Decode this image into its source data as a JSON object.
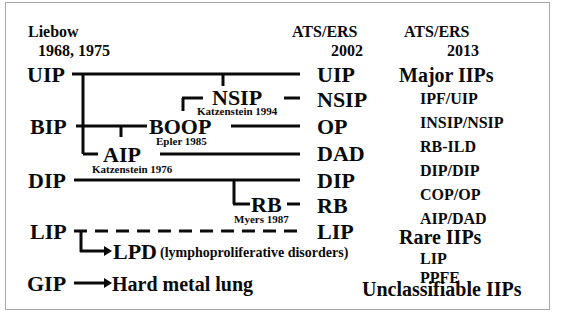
{
  "columns": {
    "liebow": {
      "title": "Liebow",
      "years": "1968, 1975"
    },
    "ats2002": {
      "title": "ATS/ERS",
      "year": "2002"
    },
    "ats2013": {
      "title": "ATS/ERS",
      "year": "2013"
    }
  },
  "liebow_terms": [
    "UIP",
    "BIP",
    "DIP",
    "LIP",
    "GIP"
  ],
  "intermediate": {
    "nsip": {
      "label": "NSIP",
      "citation": "Katzenstein 1994"
    },
    "boop": {
      "label": "BOOP",
      "citation": "Epler 1985"
    },
    "aip": {
      "label": "AIP",
      "citation": "Katzenstein 1976"
    },
    "rb": {
      "label": "RB",
      "citation": "Myers 1987"
    },
    "lpd": {
      "label": "LPD",
      "note": "(lymphoproliferative disorders)"
    },
    "hard_metal": {
      "label": "Hard metal lung"
    }
  },
  "ats2002_terms": [
    "UIP",
    "NSIP",
    "OP",
    "DAD",
    "DIP",
    "RB",
    "LIP"
  ],
  "ats2013": {
    "major_heading": "Major IIPs",
    "major": [
      "IPF/UIP",
      "INSIP/NSIP",
      "RB-ILD",
      "DIP/DIP",
      "COP/OP",
      "AIP/DAD"
    ],
    "rare_heading": "Rare IIPs",
    "rare": [
      "LIP",
      "PPFE"
    ],
    "unclassifiable": "Unclassifiable IIPs"
  },
  "colors": {
    "ink": "#0a0a0a",
    "frame": "#a8a8a8",
    "background": "#ffffff"
  }
}
